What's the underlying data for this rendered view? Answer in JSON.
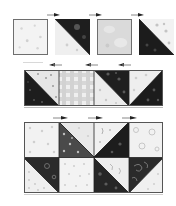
{
  "figure": {
    "colors": {
      "light": "#eeeeee",
      "light_print": "#f4f4f4",
      "medium_light": "#d9d9d9",
      "check": "#dcdcdc",
      "dark": "#1e1e1e",
      "medium_dark": "#4a4a4a",
      "border": "#6e6e6e",
      "arrow": "#222222"
    }
  },
  "row1": {
    "label": "Step 1 units",
    "units": [
      {
        "type": "solid",
        "fabric": "light-print"
      },
      {
        "type": "hst",
        "fabric": "dark/light",
        "diagonal": "tl-br",
        "dark_side": "top-right"
      },
      {
        "type": "solid",
        "fabric": "medium-light"
      },
      {
        "type": "hst",
        "fabric": "light/dark",
        "diagonal": "tl-br",
        "dark_side": "bottom-left"
      }
    ],
    "arrows_above": [
      "right",
      "right",
      "right"
    ],
    "arrows_below": [
      "left",
      "left",
      "left"
    ]
  },
  "row2": {
    "label": "Step 2 row",
    "units": [
      {
        "type": "hst",
        "fabric": "light/dark",
        "diagonal": "tl-br",
        "dark_side": "bottom-left"
      },
      {
        "type": "solid",
        "fabric": "gingham-check"
      },
      {
        "type": "hst",
        "fabric": "dark/light",
        "diagonal": "tl-br",
        "dark_side": "top-right"
      },
      {
        "type": "hst",
        "fabric": "light/dark",
        "diagonal": "tr-bl",
        "dark_side": "bottom-right"
      }
    ]
  },
  "row3": {
    "label": "Step 3 block",
    "arrows_above": [
      "right",
      "right",
      "right"
    ],
    "top": [
      {
        "type": "solid",
        "fabric": "light-print"
      },
      {
        "type": "hst",
        "fabric": "dark/light",
        "diagonal": "tl-br",
        "dark_side": "bottom-left"
      },
      {
        "type": "hst",
        "fabric": "light/dark",
        "diagonal": "tr-bl",
        "dark_side": "bottom-right"
      },
      {
        "type": "solid",
        "fabric": "light-floral"
      }
    ],
    "bottom": [
      {
        "type": "hst",
        "fabric": "dark/light",
        "diagonal": "tl-br",
        "dark_side": "top-right"
      },
      {
        "type": "solid",
        "fabric": "light-dot"
      },
      {
        "type": "hst",
        "fabric": "dark/light",
        "diagonal": "tl-br",
        "dark_side": "bottom-left"
      },
      {
        "type": "hst",
        "fabric": "dark/light",
        "diagonal": "tr-bl",
        "dark_side": "top-left"
      }
    ]
  }
}
